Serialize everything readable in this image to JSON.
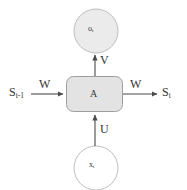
{
  "diagram": {
    "type": "recurrent-neural-network-cell",
    "nodes": {
      "output_circle": {
        "label": "o",
        "subscript": "t",
        "shape": "circle",
        "fill": "#ebebeb",
        "stroke": "#b5b5b5",
        "cx": 96,
        "cy": 31,
        "r": 22
      },
      "cell_box": {
        "label": "A",
        "shape": "rounded-rect",
        "fill": "#e3e3e3",
        "stroke": "#9a9a9a",
        "x": 66,
        "y": 76,
        "width": 56,
        "height": 36,
        "radius": 7
      },
      "input_circle": {
        "label": "x",
        "subscript": "t",
        "shape": "circle",
        "fill": "#ffffff",
        "stroke": "#b5b5b5",
        "cx": 96,
        "cy": 168,
        "r": 22
      }
    },
    "state_labels": {
      "previous": "S",
      "previous_subscript": "t-1",
      "next": "S",
      "next_subscript": "t"
    },
    "edges": [
      {
        "name": "input-to-cell",
        "weight": "U",
        "direction": "up",
        "from": "input_circle",
        "to": "cell_box"
      },
      {
        "name": "cell-to-output",
        "weight": "V",
        "direction": "up",
        "from": "cell_box",
        "to": "output_circle"
      },
      {
        "name": "prev-state-to-cell",
        "weight": "W",
        "direction": "right",
        "from": "S_t-1",
        "to": "cell_box"
      },
      {
        "name": "cell-to-next-state",
        "weight": "W",
        "direction": "right",
        "from": "cell_box",
        "to": "S_t"
      }
    ],
    "colors": {
      "background": "#ffffff",
      "line": "#4a4a4a",
      "text": "#333333",
      "box_fill": "#e3e3e3",
      "box_stroke": "#9a9a9a",
      "circle_fill_top": "#ebebeb",
      "circle_fill_bottom": "#ffffff",
      "circle_stroke": "#b5b5b5"
    }
  }
}
